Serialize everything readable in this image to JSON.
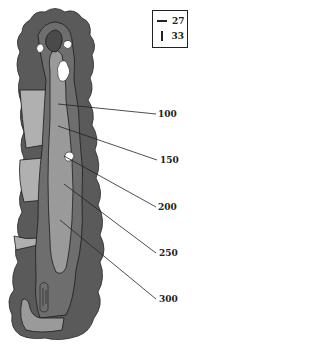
{
  "legend": {
    "items": [
      {
        "symbol": "horizontal-line",
        "value": "27"
      },
      {
        "symbol": "vertical-line",
        "value": "33"
      }
    ]
  },
  "yardage_markers": [
    {
      "label": "100",
      "x": 158,
      "y": 114
    },
    {
      "label": "150",
      "x": 160,
      "y": 160
    },
    {
      "label": "200",
      "x": 158,
      "y": 207
    },
    {
      "label": "250",
      "x": 159,
      "y": 253
    },
    {
      "label": "300",
      "x": 159,
      "y": 299
    }
  ],
  "colors": {
    "trees": "#5a5a5a",
    "rough": "#6e6e6e",
    "fairway": "#9a9a9a",
    "green": "#4a4a4a",
    "fringe": "#8a8a8a",
    "water_path": "#b5b5b5",
    "bunker": "#ffffff",
    "outline": "#1a1a1a"
  }
}
